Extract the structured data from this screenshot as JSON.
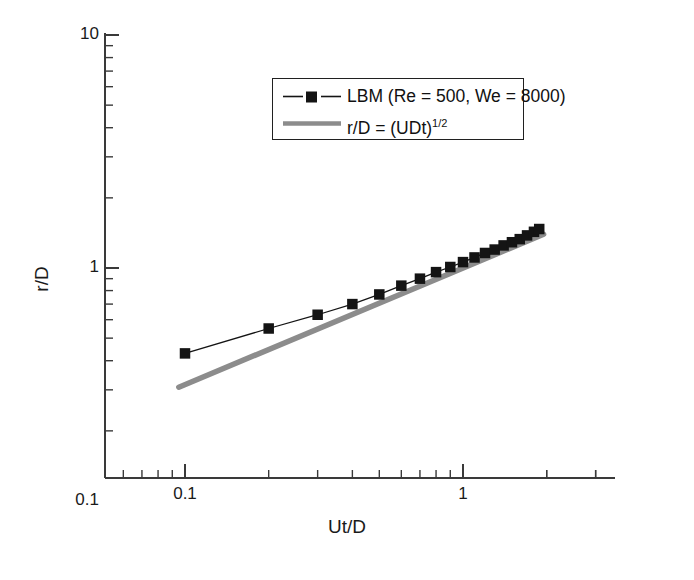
{
  "chart_data": {
    "type": "line",
    "title": "",
    "xlabel": "Ut/D",
    "ylabel": "r/D",
    "xscale": "log",
    "yscale": "log",
    "xlim": [
      0.07,
      3.2
    ],
    "ylim": [
      0.1,
      10
    ],
    "grid": false,
    "x_major_ticks": [
      0.1,
      1
    ],
    "x_major_ticklabels": [
      "0.1",
      "1"
    ],
    "y_major_ticks": [
      0.1,
      1,
      10
    ],
    "y_major_ticklabels": [
      "0.1",
      "1",
      "10"
    ],
    "legend_position": "upper center",
    "series": [
      {
        "name": "LBM (Re = 500, We = 8000)",
        "marker": "filled-square",
        "color": "#141414",
        "linestyle": "solid-thin",
        "x": [
          0.1,
          0.2,
          0.3,
          0.4,
          0.5,
          0.6,
          0.7,
          0.8,
          0.9,
          1.0,
          1.1,
          1.2,
          1.3,
          1.4,
          1.5,
          1.6,
          1.7,
          1.8,
          1.88
        ],
        "y": [
          0.43,
          0.55,
          0.63,
          0.7,
          0.77,
          0.84,
          0.9,
          0.96,
          1.01,
          1.06,
          1.11,
          1.16,
          1.2,
          1.25,
          1.29,
          1.33,
          1.38,
          1.43,
          1.47
        ]
      },
      {
        "name": "r/D = (UDt)^1/2",
        "marker": "none",
        "color": "#8c8c8c",
        "linestyle": "thick",
        "x": [
          0.095,
          1.95
        ],
        "y": [
          0.308,
          1.396
        ]
      }
    ]
  },
  "legend": {
    "entries": [
      {
        "label": "LBM (Re = 500, We = 8000)",
        "style": "marker-line",
        "color": "#141414"
      },
      {
        "label_main": "r/D = (UDt)",
        "label_sup": "1/2",
        "style": "thick-line",
        "color": "#8c8c8c"
      }
    ]
  },
  "axes": {
    "x_title": "Ut/D",
    "y_title": "r/D",
    "x_ticklabels": [
      "0.1",
      "1"
    ],
    "y_ticklabels": [
      "10",
      "1",
      "0.1"
    ]
  }
}
